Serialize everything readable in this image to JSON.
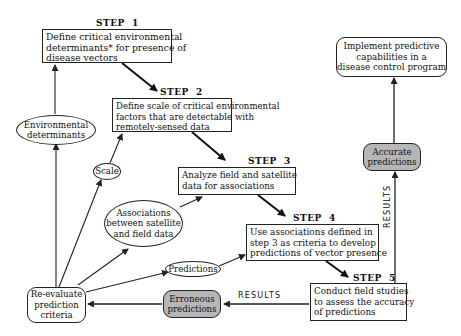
{
  "steps": [
    {
      "label": "STEP  1",
      "lines": [
        "Define critical environmental",
        "determinants* for presence of",
        "disease vectors"
      ]
    },
    {
      "label": "STEP  2",
      "lines": [
        "Define scale of critical environmental",
        "factors that are detectable with",
        "remotely-sensed data"
      ]
    },
    {
      "label": "STEP  3",
      "lines": [
        "Analyze field and satellite",
        "data for associations"
      ]
    },
    {
      "label": "STEP  4",
      "lines": [
        "Use associations defined in",
        "step 3 as criteria to develop",
        "predictions of vector presence"
      ]
    },
    {
      "label": "STEP  5",
      "lines": [
        "Conduct field studies",
        "to assess the accuracy",
        "of predictions"
      ]
    }
  ],
  "implement": {
    "lines": [
      "Implement predictive",
      "capabilities in a",
      "disease control program"
    ]
  },
  "accurate": {
    "lines": [
      "Accurate",
      "predictions"
    ]
  },
  "erroneous": {
    "lines": [
      "Erroneous",
      "predictions"
    ]
  },
  "reevaluate": {
    "lines": [
      "Re-evaluate",
      "prediction",
      "criteria"
    ]
  },
  "ellipses": {
    "environmental": {
      "lines": [
        "Environmental",
        "determinants"
      ]
    },
    "scale": {
      "lines": [
        "Scale"
      ]
    },
    "associations": {
      "lines": [
        "Associations",
        "between satellite",
        "and field data"
      ]
    },
    "predictions": {
      "lines": [
        "Predictions"
      ]
    }
  },
  "results_labels": {
    "horizontal": "RESULTS",
    "vertical": "RESULTS"
  },
  "colors": {
    "line": "#222222",
    "shaded_box": "#b6b6b6",
    "background": "#ffffff"
  }
}
